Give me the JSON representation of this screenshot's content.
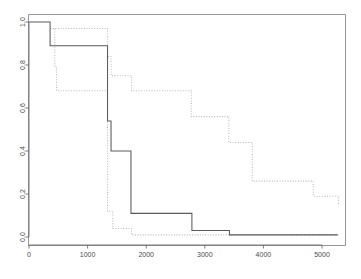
{
  "chart_data": {
    "type": "line",
    "subtype": "step-survival-curve",
    "title": "",
    "subtitle": "",
    "xlabel": "",
    "ylabel": "",
    "xlim": [
      0,
      5400
    ],
    "ylim": [
      0.0,
      1.02
    ],
    "grid": false,
    "legend_position": "none",
    "legend_entries": [],
    "annotations": [],
    "xticks": [
      0,
      1000,
      2000,
      3000,
      4000,
      5000
    ],
    "xtick_labels": [
      "0",
      "1000",
      "2000",
      "3000",
      "4000",
      "5000"
    ],
    "yticks": [
      0.0,
      0.2,
      0.4,
      0.6,
      0.8,
      1.0
    ],
    "ytick_labels": [
      "0.0",
      "0.2",
      "0.4",
      "0.6",
      "0.8",
      "1.0"
    ],
    "ytick_rotation_deg": 90,
    "series": [
      {
        "name": "solid-curve",
        "style": "solid",
        "color": "#5a5a5a",
        "x": [
          0,
          360,
          360,
          1340,
          1340,
          1400,
          1400,
          1740,
          1740,
          2780,
          2780,
          3420,
          3420,
          5270
        ],
        "y": [
          1.0,
          1.0,
          0.89,
          0.89,
          0.54,
          0.54,
          0.4,
          0.4,
          0.11,
          0.11,
          0.03,
          0.03,
          0.01,
          0.01
        ]
      },
      {
        "name": "dotted-curve",
        "style": "dotted",
        "color": "#b9b9b9",
        "x": [
          360,
          440,
          440,
          470,
          470,
          1330,
          1330,
          1370,
          1370,
          1400,
          1400,
          1420,
          1420,
          1460,
          1460,
          1740,
          1740,
          2760,
          2760,
          3400,
          3400,
          3520,
          3520,
          3800,
          3800,
          4840,
          4840,
          5220,
          5220,
          5280
        ],
        "y": [
          0.97,
          0.97,
          0.79,
          0.79,
          0.68,
          0.68,
          0.84,
          0.84,
          0.75,
          0.75,
          0.12,
          0.12,
          0.04,
          0.04,
          0.01,
          0.01,
          0.75,
          0.75,
          0.68,
          0.68,
          0.56,
          0.56,
          0.44,
          0.44,
          0.26,
          0.26,
          0.19,
          0.19,
          0.15,
          0.15
        ]
      }
    ],
    "series_solid_steps": [
      {
        "x": 0,
        "y": 1.0
      },
      {
        "x": 360,
        "y": 0.89
      },
      {
        "x": 1340,
        "y": 0.54
      },
      {
        "x": 1400,
        "y": 0.4
      },
      {
        "x": 1740,
        "y": 0.11
      },
      {
        "x": 2780,
        "y": 0.03
      },
      {
        "x": 3420,
        "y": 0.01
      },
      {
        "x": 5270,
        "y": 0.01
      }
    ],
    "series_dotted_upper_steps": [
      {
        "x": 360,
        "y": 0.97
      },
      {
        "x": 1330,
        "y": 0.97
      },
      {
        "x": 1340,
        "y": 0.84
      },
      {
        "x": 1400,
        "y": 0.75
      },
      {
        "x": 1740,
        "y": 0.75
      },
      {
        "x": 1750,
        "y": 0.68
      },
      {
        "x": 2760,
        "y": 0.68
      },
      {
        "x": 2770,
        "y": 0.56
      },
      {
        "x": 3400,
        "y": 0.56
      },
      {
        "x": 3410,
        "y": 0.44
      },
      {
        "x": 3800,
        "y": 0.44
      },
      {
        "x": 3810,
        "y": 0.26
      },
      {
        "x": 4840,
        "y": 0.26
      },
      {
        "x": 4850,
        "y": 0.19
      },
      {
        "x": 5220,
        "y": 0.19
      },
      {
        "x": 5280,
        "y": 0.15
      }
    ],
    "series_dotted_lower_steps": [
      {
        "x": 360,
        "y": 0.97
      },
      {
        "x": 440,
        "y": 0.79
      },
      {
        "x": 470,
        "y": 0.68
      },
      {
        "x": 1330,
        "y": 0.68
      },
      {
        "x": 1340,
        "y": 0.12
      },
      {
        "x": 1420,
        "y": 0.12
      },
      {
        "x": 1430,
        "y": 0.04
      },
      {
        "x": 1740,
        "y": 0.04
      },
      {
        "x": 1750,
        "y": 0.01
      },
      {
        "x": 5280,
        "y": 0.01
      }
    ]
  }
}
